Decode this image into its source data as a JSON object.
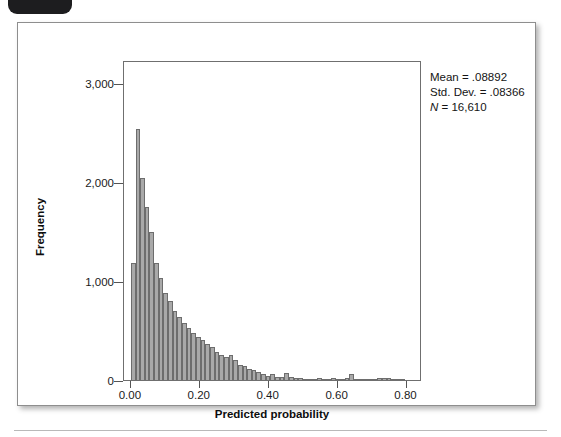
{
  "figure": {
    "corner_tab_label": "",
    "background_color": "#ffffff",
    "card_border_color": "#8e8e8e"
  },
  "annotations": {
    "mean_text": "Mean = .08892",
    "std_dev_text": "Std. Dev. = .08366",
    "n_symbol": "N",
    "n_text": " = 16,610"
  },
  "chart_data": {
    "type": "bar",
    "title": "",
    "subtitle": "",
    "xlabel": "Predicted probability",
    "ylabel": "Frequency",
    "xlim": [
      -0.02,
      0.845
    ],
    "ylim": [
      0,
      3230
    ],
    "grid": false,
    "legend": null,
    "bar_fill_color": "#a9a9a9",
    "bar_edge_color": "#6d6d6d",
    "x_ticks": [
      0.0,
      0.2,
      0.4,
      0.6,
      0.8
    ],
    "x_tick_labels": [
      "0.00",
      "0.20",
      "0.40",
      "0.60",
      "0.80"
    ],
    "y_ticks": [
      0,
      1000,
      2000,
      3000
    ],
    "y_tick_labels": [
      "0",
      "1,000",
      "2,000",
      "3,000"
    ],
    "bin_width": 0.0135,
    "bins": [
      {
        "x": 0.0,
        "value": 1180
      },
      {
        "x": 0.0135,
        "value": 2530
      },
      {
        "x": 0.027,
        "value": 2040
      },
      {
        "x": 0.0405,
        "value": 1750
      },
      {
        "x": 0.054,
        "value": 1490
      },
      {
        "x": 0.0675,
        "value": 1180
      },
      {
        "x": 0.081,
        "value": 1030
      },
      {
        "x": 0.0945,
        "value": 880
      },
      {
        "x": 0.108,
        "value": 800
      },
      {
        "x": 0.1215,
        "value": 700
      },
      {
        "x": 0.135,
        "value": 640
      },
      {
        "x": 0.1485,
        "value": 580
      },
      {
        "x": 0.162,
        "value": 520
      },
      {
        "x": 0.1755,
        "value": 470
      },
      {
        "x": 0.189,
        "value": 430
      },
      {
        "x": 0.2025,
        "value": 400
      },
      {
        "x": 0.216,
        "value": 360
      },
      {
        "x": 0.2295,
        "value": 330
      },
      {
        "x": 0.243,
        "value": 280
      },
      {
        "x": 0.2565,
        "value": 250
      },
      {
        "x": 0.27,
        "value": 230
      },
      {
        "x": 0.2835,
        "value": 250
      },
      {
        "x": 0.297,
        "value": 200
      },
      {
        "x": 0.3105,
        "value": 155
      },
      {
        "x": 0.324,
        "value": 140
      },
      {
        "x": 0.3375,
        "value": 115
      },
      {
        "x": 0.351,
        "value": 100
      },
      {
        "x": 0.3645,
        "value": 80
      },
      {
        "x": 0.378,
        "value": 60
      },
      {
        "x": 0.3915,
        "value": 45
      },
      {
        "x": 0.405,
        "value": 60
      },
      {
        "x": 0.4185,
        "value": 35
      },
      {
        "x": 0.432,
        "value": 30
      },
      {
        "x": 0.4455,
        "value": 75
      },
      {
        "x": 0.459,
        "value": 30
      },
      {
        "x": 0.4725,
        "value": 25
      },
      {
        "x": 0.486,
        "value": 18
      },
      {
        "x": 0.4995,
        "value": 14
      },
      {
        "x": 0.513,
        "value": 10
      },
      {
        "x": 0.5265,
        "value": 8
      },
      {
        "x": 0.54,
        "value": 22
      },
      {
        "x": 0.5535,
        "value": 9
      },
      {
        "x": 0.567,
        "value": 6
      },
      {
        "x": 0.5805,
        "value": 20
      },
      {
        "x": 0.594,
        "value": 5
      },
      {
        "x": 0.6075,
        "value": 7
      },
      {
        "x": 0.621,
        "value": 18
      },
      {
        "x": 0.6345,
        "value": 60
      },
      {
        "x": 0.648,
        "value": 6
      },
      {
        "x": 0.6615,
        "value": 5
      },
      {
        "x": 0.675,
        "value": 4
      },
      {
        "x": 0.6885,
        "value": 3
      },
      {
        "x": 0.702,
        "value": 3
      },
      {
        "x": 0.7155,
        "value": 20
      },
      {
        "x": 0.729,
        "value": 24
      },
      {
        "x": 0.7425,
        "value": 22
      },
      {
        "x": 0.756,
        "value": 8
      },
      {
        "x": 0.7695,
        "value": 3
      },
      {
        "x": 0.783,
        "value": 2
      }
    ]
  }
}
